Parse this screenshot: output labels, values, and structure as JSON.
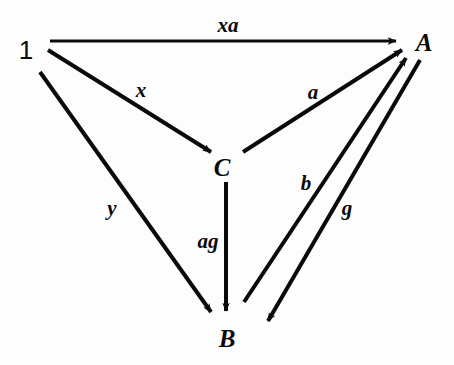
{
  "diagram": {
    "background_color": "#fdfdfd",
    "ink_color": "#0a0a0a",
    "nodes": [
      {
        "id": "one",
        "label": "1",
        "x": 26,
        "y": 50,
        "style": "upright"
      },
      {
        "id": "A",
        "label": "A",
        "x": 424,
        "y": 42,
        "style": "italic"
      },
      {
        "id": "C",
        "label": "C",
        "x": 222,
        "y": 167,
        "style": "italic"
      },
      {
        "id": "B",
        "label": "B",
        "x": 227,
        "y": 338,
        "style": "italic"
      }
    ],
    "edges": [
      {
        "id": "xa",
        "label": "xa",
        "from": "one",
        "to": "A",
        "label_x": 228,
        "label_y": 25,
        "x1": 50,
        "y1": 41,
        "x2": 396,
        "y2": 41
      },
      {
        "id": "x",
        "label": "x",
        "from": "one",
        "to": "C",
        "label_x": 141,
        "label_y": 90,
        "x1": 48,
        "y1": 50,
        "x2": 211,
        "y2": 152
      },
      {
        "id": "y",
        "label": "y",
        "from": "one",
        "to": "B",
        "label_x": 112,
        "label_y": 208,
        "x1": 40,
        "y1": 72,
        "x2": 211,
        "y2": 312
      },
      {
        "id": "a",
        "label": "a",
        "from": "C",
        "to": "A",
        "label_x": 313,
        "label_y": 92,
        "x1": 243,
        "y1": 152,
        "x2": 402,
        "y2": 50
      },
      {
        "id": "ag",
        "label": "ag",
        "from": "C",
        "to": "B",
        "label_x": 208,
        "label_y": 241,
        "x1": 226,
        "y1": 182,
        "x2": 226,
        "y2": 311
      },
      {
        "id": "b",
        "label": "b",
        "from": "B",
        "to": "A",
        "label_x": 306,
        "label_y": 183,
        "x1": 244,
        "y1": 302,
        "x2": 406,
        "y2": 58
      },
      {
        "id": "g",
        "label": "g",
        "from": "A",
        "to": "B",
        "label_x": 347,
        "label_y": 208,
        "x1": 420,
        "y1": 60,
        "x2": 268,
        "y2": 321
      }
    ]
  }
}
